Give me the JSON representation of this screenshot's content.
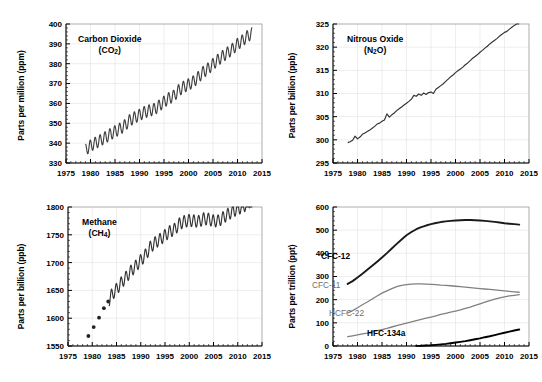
{
  "figure": {
    "background": "#ffffff",
    "panel_count": 4
  },
  "chart_data": [
    {
      "type": "line",
      "panel": "top-left",
      "title": "Carbon Dioxide",
      "title_formula": "(CO2)",
      "species": "CO2",
      "xlabel": "",
      "ylabel": "Parts per million (ppm)",
      "units": "ppm",
      "xlim": [
        1975,
        2015
      ],
      "ylim": [
        330,
        400
      ],
      "xticks": [
        1975,
        1980,
        1985,
        1990,
        1995,
        2000,
        2005,
        2010,
        2015
      ],
      "yticks": [
        330,
        340,
        350,
        360,
        370,
        380,
        390,
        400
      ],
      "grid": true,
      "color": "#404040",
      "seasonal_cycle": true,
      "seasonal_amplitude": 3.0,
      "x": [
        1979.0,
        1980.0,
        1981.0,
        1982.0,
        1983.0,
        1984.0,
        1985.0,
        1986.0,
        1987.0,
        1988.0,
        1989.0,
        1990.0,
        1991.0,
        1992.0,
        1993.0,
        1994.0,
        1995.0,
        1996.0,
        1997.0,
        1998.0,
        1999.0,
        2000.0,
        2001.0,
        2002.0,
        2003.0,
        2004.0,
        2005.0,
        2006.0,
        2007.0,
        2008.0,
        2009.0,
        2010.0,
        2011.0,
        2012.0,
        2013.0
      ],
      "values": [
        336.8,
        338.7,
        340.1,
        341.4,
        342.9,
        344.4,
        345.9,
        347.2,
        348.9,
        351.5,
        352.9,
        354.2,
        355.6,
        356.4,
        357.1,
        358.8,
        360.8,
        362.6,
        363.8,
        366.6,
        368.3,
        369.5,
        371.0,
        373.2,
        375.8,
        377.5,
        379.8,
        381.9,
        383.8,
        385.6,
        387.4,
        389.9,
        391.6,
        393.8,
        395.3
      ],
      "data_start_year": 1979.0,
      "data_end_year": 2013.0
    },
    {
      "type": "line",
      "panel": "top-right",
      "title": "Nitrous Oxide",
      "title_formula": "(N2O)",
      "species": "N2O",
      "xlabel": "",
      "ylabel": "Parts per billion (ppb)",
      "units": "ppb",
      "xlim": [
        1975,
        2015
      ],
      "ylim": [
        295,
        325
      ],
      "xticks": [
        1975,
        1980,
        1985,
        1990,
        1995,
        2000,
        2005,
        2010,
        2015
      ],
      "yticks": [
        295,
        300,
        305,
        310,
        315,
        320,
        325
      ],
      "grid": true,
      "color": "#333333",
      "seasonal_cycle": false,
      "x": [
        1978.0,
        1978.5,
        1979.0,
        1979.5,
        1980.0,
        1980.5,
        1981.0,
        1981.5,
        1982.0,
        1982.5,
        1983.0,
        1983.5,
        1984.0,
        1984.5,
        1985.0,
        1985.5,
        1986.0,
        1986.5,
        1987.0,
        1987.5,
        1988.0,
        1988.5,
        1989.0,
        1989.5,
        1990.0,
        1990.5,
        1991.0,
        1991.5,
        1992.0,
        1992.5,
        1993.0,
        1993.5,
        1994.0,
        1994.5,
        1995.0,
        1995.5,
        1996.0,
        1996.5,
        1997.0,
        1997.5,
        1998.0,
        1998.5,
        1999.0,
        1999.5,
        2000.0,
        2000.5,
        2001.0,
        2001.5,
        2002.0,
        2002.5,
        2003.0,
        2003.5,
        2004.0,
        2004.5,
        2005.0,
        2005.5,
        2006.0,
        2006.5,
        2007.0,
        2007.5,
        2008.0,
        2008.5,
        2009.0,
        2009.5,
        2010.0,
        2010.5,
        2011.0,
        2011.5,
        2012.0,
        2012.5,
        2013.0
      ],
      "values": [
        299.4,
        299.6,
        299.9,
        300.8,
        300.2,
        300.6,
        301.2,
        301.5,
        301.8,
        302.1,
        302.5,
        302.9,
        303.4,
        303.6,
        304.0,
        304.3,
        305.6,
        304.9,
        305.4,
        305.8,
        306.3,
        306.7,
        307.1,
        307.5,
        307.9,
        308.3,
        308.8,
        309.6,
        309.4,
        309.9,
        309.6,
        310.1,
        309.8,
        310.2,
        310.3,
        310.0,
        310.9,
        311.3,
        311.7,
        312.1,
        312.6,
        313.1,
        313.6,
        314.0,
        314.5,
        314.9,
        315.3,
        315.7,
        316.2,
        316.6,
        317.1,
        317.6,
        318.0,
        318.4,
        318.9,
        319.3,
        319.8,
        320.2,
        320.7,
        321.1,
        321.5,
        321.9,
        322.4,
        322.8,
        323.2,
        323.4,
        323.9,
        324.3,
        324.7,
        325.0,
        325.4
      ],
      "data_start_year": 1978.0,
      "data_end_year": 2013.0
    },
    {
      "type": "line",
      "panel": "bottom-left",
      "title": "Methane",
      "title_formula": "(CH4)",
      "species": "CH4",
      "xlabel": "",
      "ylabel": "Parts per billion (ppb)",
      "units": "ppb",
      "xlim": [
        1975,
        2015
      ],
      "ylim": [
        1550,
        1800
      ],
      "xticks": [
        1975,
        1980,
        1985,
        1990,
        1995,
        2000,
        2005,
        2010,
        2015
      ],
      "yticks": [
        1550,
        1600,
        1650,
        1700,
        1750,
        1800
      ],
      "grid": true,
      "color": "#333333",
      "seasonal_cycle": true,
      "seasonal_amplitude": 11.0,
      "marker_points_x": [
        1979.2,
        1980.3,
        1981.4,
        1982.4,
        1983.3
      ],
      "marker_points_y": [
        1568,
        1584,
        1601,
        1618,
        1630
      ],
      "x": [
        1983.5,
        1984.0,
        1985.0,
        1986.0,
        1987.0,
        1988.0,
        1989.0,
        1990.0,
        1991.0,
        1992.0,
        1993.0,
        1994.0,
        1995.0,
        1996.0,
        1997.0,
        1998.0,
        1999.0,
        2000.0,
        2001.0,
        2002.0,
        2003.0,
        2004.0,
        2005.0,
        2006.0,
        2007.0,
        2008.0,
        2009.0,
        2010.0,
        2011.0,
        2012.0,
        2013.0
      ],
      "values": [
        1632,
        1642,
        1652,
        1664,
        1674,
        1685,
        1694,
        1704,
        1714,
        1728,
        1736,
        1742,
        1749,
        1756,
        1760,
        1770,
        1774,
        1776,
        1775,
        1774,
        1779,
        1778,
        1775,
        1775,
        1781,
        1787,
        1792,
        1797,
        1800,
        1806,
        1814
      ],
      "data_start_year": 1979.0,
      "data_end_year": 2013.0
    },
    {
      "type": "line",
      "panel": "bottom-right",
      "title": "",
      "title_formula": "",
      "species": "Halocarbons",
      "xlabel": "",
      "ylabel": "Parts per trillion (ppt)",
      "units": "ppt",
      "xlim": [
        1975,
        2015
      ],
      "ylim": [
        0,
        600
      ],
      "xticks": [
        1975,
        1980,
        1985,
        1990,
        1995,
        2000,
        2005,
        2010,
        2015
      ],
      "yticks": [
        0,
        100,
        200,
        300,
        400,
        500,
        600
      ],
      "grid": true,
      "legend_position": "inline-labels",
      "series": [
        {
          "name": "CFC-12",
          "color": "#1a1a1a",
          "label_color": "#000000",
          "label_bold": true,
          "x": [
            1978,
            1979,
            1980,
            1981,
            1982,
            1983,
            1984,
            1985,
            1986,
            1987,
            1988,
            1989,
            1990,
            1991,
            1992,
            1993,
            1994,
            1995,
            1996,
            1997,
            1998,
            1999,
            2000,
            2001,
            2002,
            2003,
            2004,
            2005,
            2006,
            2007,
            2008,
            2009,
            2010,
            2011,
            2012,
            2013
          ],
          "values": [
            268,
            280,
            296,
            312,
            329,
            346,
            364,
            382,
            401,
            421,
            441,
            460,
            478,
            492,
            504,
            513,
            520,
            526,
            531,
            535,
            538,
            540,
            542,
            543,
            544,
            544,
            543,
            542,
            540,
            538,
            536,
            533,
            530,
            528,
            526,
            524
          ]
        },
        {
          "name": "CFC-11",
          "color": "#808080",
          "label_color": "#6e6e6e",
          "label_bold": false,
          "x": [
            1978,
            1979,
            1980,
            1981,
            1982,
            1983,
            1984,
            1985,
            1986,
            1987,
            1988,
            1989,
            1990,
            1991,
            1992,
            1993,
            1994,
            1995,
            1996,
            1997,
            1998,
            1999,
            2000,
            2001,
            2002,
            2003,
            2004,
            2005,
            2006,
            2007,
            2008,
            2009,
            2010,
            2011,
            2012,
            2013
          ],
          "values": [
            143,
            153,
            165,
            178,
            190,
            203,
            216,
            228,
            238,
            248,
            256,
            262,
            265,
            267,
            268,
            268,
            267,
            266,
            265,
            263,
            262,
            260,
            258,
            256,
            254,
            252,
            250,
            248,
            246,
            244,
            242,
            240,
            238,
            236,
            234,
            232
          ]
        },
        {
          "name": "HCFC-22",
          "color": "#808080",
          "label_color": "#6e6e6e",
          "label_bold": false,
          "x": [
            1978,
            1979,
            1980,
            1981,
            1982,
            1983,
            1984,
            1985,
            1986,
            1987,
            1988,
            1989,
            1990,
            1991,
            1992,
            1993,
            1994,
            1995,
            1996,
            1997,
            1998,
            1999,
            2000,
            2001,
            2002,
            2003,
            2004,
            2005,
            2006,
            2007,
            2008,
            2009,
            2010,
            2011,
            2012,
            2013
          ],
          "values": [
            40,
            44,
            48,
            52,
            56,
            61,
            66,
            71,
            76,
            82,
            88,
            93,
            99,
            104,
            110,
            115,
            120,
            125,
            130,
            136,
            141,
            146,
            151,
            156,
            162,
            168,
            175,
            182,
            189,
            196,
            202,
            208,
            212,
            216,
            219,
            222
          ]
        },
        {
          "name": "HFC-134a",
          "color": "#000000",
          "label_color": "#000000",
          "label_bold": true,
          "x": [
            1992,
            1993,
            1994,
            1995,
            1996,
            1997,
            1998,
            1999,
            2000,
            2001,
            2002,
            2003,
            2004,
            2005,
            2006,
            2007,
            2008,
            2009,
            2010,
            2011,
            2012,
            2013
          ],
          "values": [
            0.5,
            1,
            2,
            3,
            5,
            7,
            9,
            12,
            15,
            18,
            21,
            25,
            29,
            33,
            38,
            42,
            47,
            52,
            57,
            62,
            67,
            71
          ]
        }
      ]
    }
  ],
  "panels": {
    "co2": {
      "title_line1": "Carbon Dioxide",
      "title_line2_pre": "(CO",
      "title_line2_sub": "2",
      "title_line2_post": ")",
      "ylabel": "Parts per million (ppm)"
    },
    "n2o": {
      "title_line1": "Nitrous Oxide",
      "title_line2_pre": "(N",
      "title_line2_sub": "2",
      "title_line2_post": "O)",
      "ylabel": "Parts per billion (ppb)"
    },
    "ch4": {
      "title_line1": "Methane",
      "title_line2_pre": "(CH",
      "title_line2_sub": "4",
      "title_line2_post": ")",
      "ylabel": "Parts per billion (ppb)"
    },
    "halo": {
      "ylabel": "Parts per trillion (ppt)",
      "label_cfc12": "CFC-12",
      "label_cfc11": "CFC-11",
      "label_hcfc22": "HCFC-22",
      "label_hfc134a": "HFC-134a"
    }
  }
}
